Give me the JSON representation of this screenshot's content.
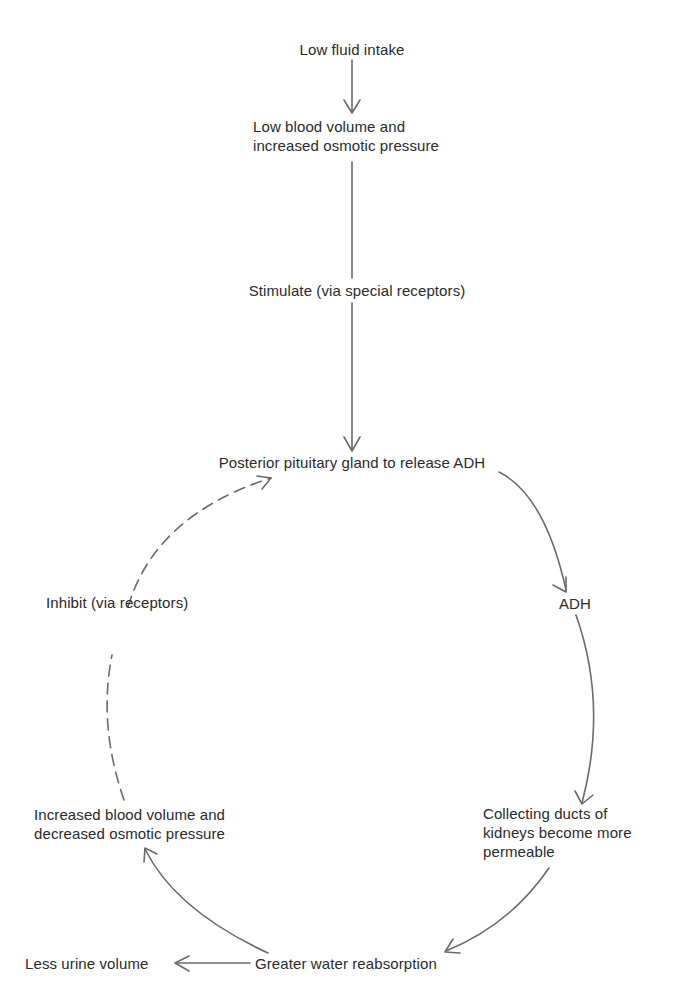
{
  "diagram": {
    "type": "flowchart-feedback-loop",
    "nodes": {
      "low_fluid_intake": {
        "lines": [
          "Low fluid intake"
        ]
      },
      "low_blood_volume": {
        "lines": [
          "Low blood volume and",
          "increased osmotic pressure"
        ]
      },
      "stimulate": {
        "lines": [
          "Stimulate (via special receptors)"
        ]
      },
      "posterior_pituitary": {
        "lines": [
          "Posterior pituitary gland to release ADH"
        ]
      },
      "adh": {
        "lines": [
          "ADH"
        ]
      },
      "collecting_ducts": {
        "lines": [
          "Collecting ducts of",
          "kidneys become more",
          "permeable"
        ]
      },
      "greater_water_reabsorption": {
        "lines": [
          "Greater water reabsorption"
        ]
      },
      "less_urine_volume": {
        "lines": [
          "Less urine volume"
        ]
      },
      "increased_blood_volume": {
        "lines": [
          "Increased blood volume and",
          "decreased osmotic pressure"
        ]
      },
      "inhibit": {
        "lines": [
          "Inhibit (via receptors)"
        ]
      }
    },
    "edges": [
      {
        "from": "Low fluid intake",
        "to": "Low blood volume and increased osmotic pressure",
        "style": "solid"
      },
      {
        "from": "Low blood volume and increased osmotic pressure",
        "to": "Posterior pituitary gland to release ADH",
        "label": "Stimulate (via special receptors)",
        "style": "solid"
      },
      {
        "from": "Posterior pituitary gland to release ADH",
        "to": "ADH",
        "style": "solid"
      },
      {
        "from": "ADH",
        "to": "Collecting ducts of kidneys become more permeable",
        "style": "solid"
      },
      {
        "from": "Collecting ducts of kidneys become more permeable",
        "to": "Greater water reabsorption",
        "style": "solid"
      },
      {
        "from": "Greater water reabsorption",
        "to": "Less urine volume",
        "style": "solid"
      },
      {
        "from": "Greater water reabsorption",
        "to": "Increased blood volume and decreased osmotic pressure",
        "style": "solid"
      },
      {
        "from": "Increased blood volume and decreased osmotic pressure",
        "to": "Posterior pituitary gland to release ADH",
        "label": "Inhibit (via receptors)",
        "style": "dashed"
      }
    ],
    "colors": {
      "text": "#2a2a2a",
      "arrow": "#6a6a6a",
      "background": "#ffffff"
    }
  }
}
